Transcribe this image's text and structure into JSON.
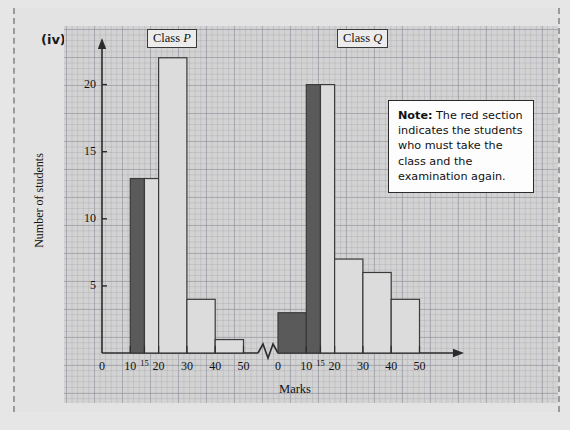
{
  "question_label": "(iv)",
  "note": {
    "lead": "Note:",
    "body": " The red section indicates the students who must take the class and the examination again."
  },
  "panels": {
    "p_title": "Class P",
    "q_title": "Class Q"
  },
  "axes": {
    "ylabel": "Number of students",
    "xlabel": "Marks",
    "y_ticks": [
      "5",
      "10",
      "15",
      "20"
    ],
    "x_ticks_p": [
      "0",
      "10",
      "15",
      "20",
      "30",
      "40",
      "50"
    ],
    "x_ticks_q": [
      "0",
      "10",
      "15",
      "20",
      "30",
      "40",
      "50"
    ]
  },
  "colors": {
    "highlight_bar": "#5a5a5a",
    "normal_bar": "#dcdcdc",
    "paper": "#d3d3d3",
    "outline": "#3a3a3a"
  },
  "chart_data": {
    "type": "bar",
    "title": "",
    "xlabel": "Marks",
    "ylabel": "Number of students",
    "ylim": [
      0,
      23
    ],
    "grid": true,
    "legend": [
      "Class P",
      "Class Q"
    ],
    "legend_position": "above-panels",
    "note": "Dark (red in original) bars indicate students who must retake the class and examination.",
    "panels": [
      {
        "name": "Class P",
        "xlim": [
          0,
          55
        ],
        "bins": [
          {
            "from": 0,
            "to": 10,
            "value": 0,
            "highlight": false
          },
          {
            "from": 10,
            "to": 15,
            "value": 13,
            "highlight": true
          },
          {
            "from": 15,
            "to": 20,
            "value": 13,
            "highlight": false
          },
          {
            "from": 20,
            "to": 30,
            "value": 22,
            "highlight": false
          },
          {
            "from": 30,
            "to": 40,
            "value": 4,
            "highlight": false
          },
          {
            "from": 40,
            "to": 50,
            "value": 1,
            "highlight": false
          }
        ]
      },
      {
        "name": "Class Q",
        "xlim": [
          0,
          55
        ],
        "bins": [
          {
            "from": 0,
            "to": 10,
            "value": 3,
            "highlight": true
          },
          {
            "from": 10,
            "to": 15,
            "value": 20,
            "highlight": true
          },
          {
            "from": 15,
            "to": 20,
            "value": 20,
            "highlight": false
          },
          {
            "from": 20,
            "to": 30,
            "value": 7,
            "highlight": false
          },
          {
            "from": 30,
            "to": 40,
            "value": 6,
            "highlight": false
          },
          {
            "from": 40,
            "to": 50,
            "value": 4,
            "highlight": false
          }
        ]
      }
    ]
  }
}
